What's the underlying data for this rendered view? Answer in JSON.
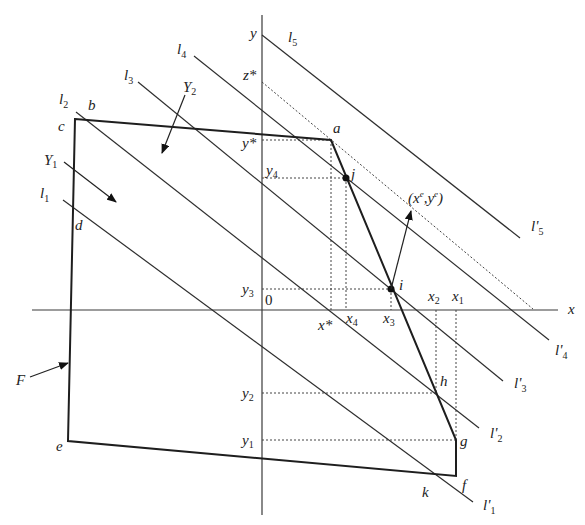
{
  "figure": {
    "type": "geometric-diagram"
  },
  "axes": {
    "x_label": "x",
    "y_label": "y",
    "origin_label": "0",
    "origin": [
      262,
      310
    ],
    "x_axis": {
      "from": [
        32,
        310
      ],
      "to": [
        558,
        310
      ]
    },
    "y_axis": {
      "from": [
        262,
        15
      ],
      "to": [
        262,
        515
      ]
    }
  },
  "region": {
    "label": "F",
    "vertices": {
      "a": [
        331,
        140
      ],
      "b": [
        98,
        119
      ],
      "c": [
        75,
        119
      ],
      "d": [
        72,
        222
      ],
      "e": [
        68,
        441
      ],
      "f": [
        456,
        476
      ],
      "g": [
        456,
        440
      ],
      "h": [
        436,
        393
      ],
      "i": [
        391,
        289
      ],
      "j": [
        346,
        178
      ],
      "k": [
        433,
        473
      ]
    },
    "polygon_order": [
      "c",
      "a",
      "g",
      "f",
      "e"
    ]
  },
  "lines": [
    {
      "name": "l1",
      "label_start": "l",
      "sub_start": "1",
      "label_end": "l'",
      "sub_end": "1",
      "from": [
        63,
        200
      ],
      "to": [
        473,
        502
      ]
    },
    {
      "name": "l2",
      "label_start": "l",
      "sub_start": "2",
      "label_end": "l'",
      "sub_end": "2",
      "from": [
        76,
        112
      ],
      "to": [
        479,
        428
      ]
    },
    {
      "name": "l3",
      "label_start": "l",
      "sub_start": "3",
      "label_end": "l'",
      "sub_end": "3",
      "from": [
        138,
        82
      ],
      "to": [
        503,
        381
      ]
    },
    {
      "name": "l4",
      "label_start": "l",
      "sub_start": "4",
      "label_end": "l'",
      "sub_end": "4",
      "from": [
        194,
        56
      ],
      "to": [
        549,
        340
      ]
    },
    {
      "name": "l5",
      "label_start": "l",
      "sub_start": "5",
      "label_end": "l'",
      "sub_end": "5",
      "from": [
        262,
        35
      ],
      "to": [
        520,
        238
      ]
    }
  ],
  "optimal_line": {
    "label": "z*",
    "from": [
      262,
      82
    ],
    "to": [
      533,
      309
    ]
  },
  "projections": {
    "y_ticks": [
      {
        "label": "y*",
        "sub": "",
        "star": true,
        "y": 140,
        "to_x": 331
      },
      {
        "label": "y",
        "sub": "4",
        "y": 178,
        "to_x": 346
      },
      {
        "label": "y",
        "sub": "3",
        "y": 289,
        "to_x": 391
      },
      {
        "label": "y",
        "sub": "2",
        "y": 393,
        "to_x": 436
      },
      {
        "label": "y",
        "sub": "1",
        "y": 440,
        "to_x": 456
      }
    ],
    "x_ticks": [
      {
        "label": "x*",
        "x": 331
      },
      {
        "label": "x",
        "sub": "4",
        "x": 346
      },
      {
        "label": "x",
        "sub": "3",
        "x": 391
      },
      {
        "label": "x",
        "sub": "2",
        "x": 436
      },
      {
        "label": "x",
        "sub": "1",
        "x": 456
      }
    ]
  },
  "annotations": {
    "Y1": {
      "label": "Y",
      "sub": "1"
    },
    "Y2": {
      "label": "Y",
      "sub": "2"
    },
    "F": "F",
    "xe_ye": {
      "open": "(",
      "x": "x",
      "xsup": "e",
      "comma": ",",
      "y": "y",
      "ysup": "e",
      "close": ")"
    }
  },
  "point_labels": {
    "a": "a",
    "b": "b",
    "c": "c",
    "d": "d",
    "e": "e",
    "f": "f",
    "g": "g",
    "h": "h",
    "i": "i",
    "j": "j",
    "k": "k"
  }
}
